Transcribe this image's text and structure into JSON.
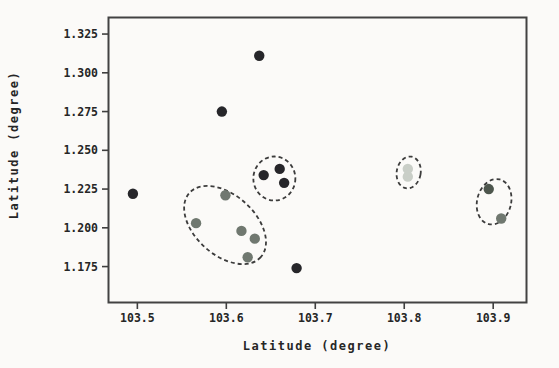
{
  "figure": {
    "background": "#fbfaf8"
  },
  "chart_data": {
    "type": "scatter",
    "title": "",
    "xlabel": "Latitude (degree)",
    "ylabel": "Latitude (degree)",
    "xlim": [
      103.467,
      103.938
    ],
    "ylim": [
      1.1515,
      1.336
    ],
    "x_ticks": [
      103.5,
      103.6,
      103.7,
      103.8,
      103.9
    ],
    "y_ticks": [
      1.175,
      1.2,
      1.225,
      1.25,
      1.275,
      1.3,
      1.325
    ],
    "x_tick_decimals": 1,
    "y_tick_decimals": 3,
    "grid": false,
    "legend": "none",
    "marker_radius_px": 5.2,
    "series": [
      {
        "name": "black-points",
        "color": "#26262a",
        "points": [
          [
            103.637,
            1.311
          ],
          [
            103.595,
            1.275
          ],
          [
            103.495,
            1.222
          ],
          [
            103.642,
            1.234
          ],
          [
            103.66,
            1.238
          ],
          [
            103.665,
            1.229
          ],
          [
            103.679,
            1.174
          ]
        ]
      },
      {
        "name": "gray-points",
        "color": "#6f786f",
        "points": [
          [
            103.599,
            1.221
          ],
          [
            103.566,
            1.203
          ],
          [
            103.617,
            1.198
          ],
          [
            103.632,
            1.193
          ],
          [
            103.624,
            1.181
          ],
          [
            103.909,
            1.206
          ]
        ]
      },
      {
        "name": "dark-gray-points",
        "color": "#4e574e",
        "points": [
          [
            103.895,
            1.225
          ]
        ]
      },
      {
        "name": "light-gray-points",
        "color": "#c9cec7",
        "points": [
          [
            103.804,
            1.238
          ],
          [
            103.804,
            1.233
          ]
        ]
      }
    ],
    "cluster_ellipses": [
      {
        "cx": 103.5986,
        "cy": 1.2018,
        "rx_px": 48,
        "ry_px": 30,
        "rotation_deg": 42
      },
      {
        "cx": 103.654,
        "cy": 1.2318,
        "rx_px": 21,
        "ry_px": 22,
        "rotation_deg": 0
      },
      {
        "cx": 103.805,
        "cy": 1.2357,
        "rx_px": 12,
        "ry_px": 16,
        "rotation_deg": 10
      },
      {
        "cx": 103.901,
        "cy": 1.2168,
        "rx_px": 17,
        "ry_px": 23,
        "rotation_deg": 14
      }
    ],
    "style": {
      "axis_color": "#424242",
      "tick_color": "#3f3f3f",
      "ellipse_color": "#3c3c3c",
      "ellipse_dash": "4 3"
    },
    "plot_box_px": {
      "left": 108,
      "top": 17,
      "right": 527,
      "bottom": 303
    }
  }
}
